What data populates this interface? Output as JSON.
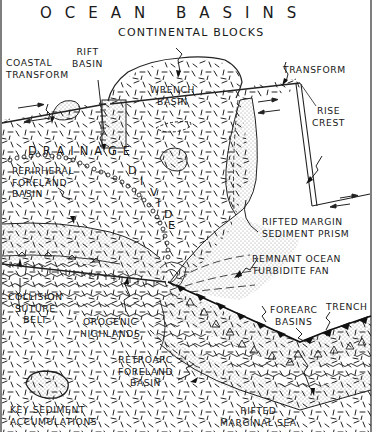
{
  "diagram": {
    "title": "OCEAN BASINS",
    "subtitle": "CONTINENTAL BLOCKS",
    "labels": {
      "coastal_transform": "COASTAL\nTRANSFORM",
      "rift_basin": "RIFT\nBASIN",
      "wrench_basin": "WRENCH\nBASIN",
      "transform": "TRANSFORM",
      "rise_crest": "RISE\nCREST",
      "drainage": "DRAINAGE",
      "divide_letters": [
        "D",
        "I",
        "V",
        "I",
        "D",
        "E"
      ],
      "peripheral_foreland_basin": "PERIPHERAL\nFORELAND\nBASIN",
      "rifted_margin_sediment_prism": "RIFTED MARGIN\nSEDIMENT PRISM",
      "remnant_ocean_turbidite_fan": "REMNANT OCEAN\nTURBIDITE FAN",
      "collision_suture_belt": "COLLISION\nSUTURE\nBELT",
      "orogenic_highlands": "OROGENIC\nHIGHLANDS",
      "forearc_basins": "FOREARC\nBASINS",
      "trench": "TRENCH",
      "retroarc_foreland_basin": "RETROARC\nFORELAND\nBASIN",
      "key_sediment_accumulations": "KEY SEDIMENT\nACCUMULATIONS",
      "rifted_marginal_sea": "RIFTED\nMARGINAL SEA"
    },
    "colors": {
      "ink": "#1a1a1a",
      "paper": "#ffffff"
    }
  }
}
